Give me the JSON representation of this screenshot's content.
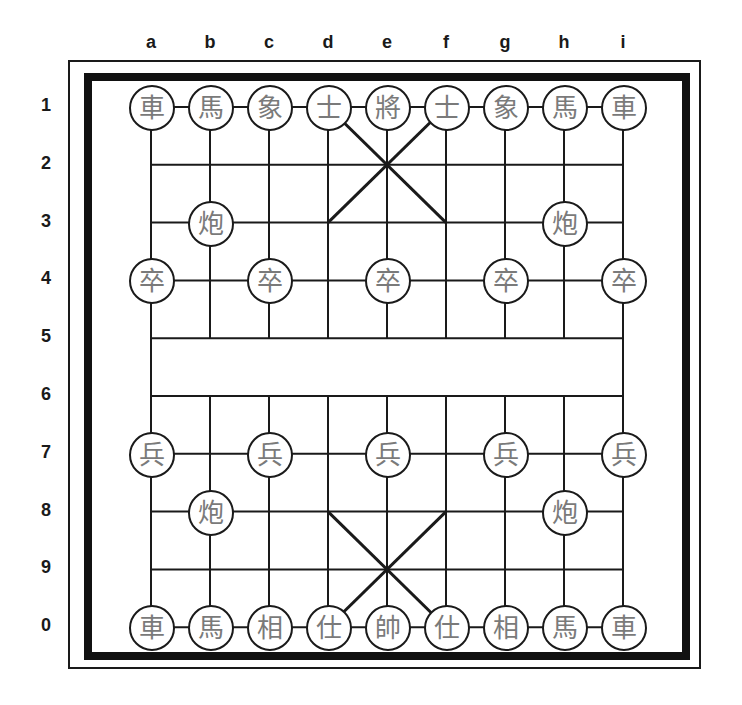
{
  "board": {
    "files": [
      "a",
      "b",
      "c",
      "d",
      "e",
      "f",
      "g",
      "h",
      "i"
    ],
    "ranks": [
      "1",
      "2",
      "3",
      "4",
      "5",
      "6",
      "7",
      "8",
      "9",
      "0"
    ],
    "colors": {
      "line": "#1a1a1a",
      "frame": "#111111",
      "piece_text": "#7a7a7a",
      "piece_bg": "#ffffff"
    },
    "river_text": ""
  },
  "pieces": [
    {
      "square": "a1",
      "glyph": "車",
      "name": "chariot"
    },
    {
      "square": "b1",
      "glyph": "馬",
      "name": "horse"
    },
    {
      "square": "c1",
      "glyph": "象",
      "name": "elephant"
    },
    {
      "square": "d1",
      "glyph": "士",
      "name": "advisor"
    },
    {
      "square": "e1",
      "glyph": "將",
      "name": "general"
    },
    {
      "square": "f1",
      "glyph": "士",
      "name": "advisor"
    },
    {
      "square": "g1",
      "glyph": "象",
      "name": "elephant"
    },
    {
      "square": "h1",
      "glyph": "馬",
      "name": "horse"
    },
    {
      "square": "i1",
      "glyph": "車",
      "name": "chariot"
    },
    {
      "square": "b3",
      "glyph": "炮",
      "name": "cannon"
    },
    {
      "square": "h3",
      "glyph": "炮",
      "name": "cannon"
    },
    {
      "square": "a4",
      "glyph": "卒",
      "name": "soldier"
    },
    {
      "square": "c4",
      "glyph": "卒",
      "name": "soldier"
    },
    {
      "square": "e4",
      "glyph": "卒",
      "name": "soldier"
    },
    {
      "square": "g4",
      "glyph": "卒",
      "name": "soldier"
    },
    {
      "square": "i4",
      "glyph": "卒",
      "name": "soldier"
    },
    {
      "square": "a7",
      "glyph": "兵",
      "name": "soldier"
    },
    {
      "square": "c7",
      "glyph": "兵",
      "name": "soldier"
    },
    {
      "square": "e7",
      "glyph": "兵",
      "name": "soldier"
    },
    {
      "square": "g7",
      "glyph": "兵",
      "name": "soldier"
    },
    {
      "square": "i7",
      "glyph": "兵",
      "name": "soldier"
    },
    {
      "square": "b8",
      "glyph": "炮",
      "name": "cannon"
    },
    {
      "square": "h8",
      "glyph": "炮",
      "name": "cannon"
    },
    {
      "square": "a0",
      "glyph": "車",
      "name": "chariot"
    },
    {
      "square": "b0",
      "glyph": "馬",
      "name": "horse"
    },
    {
      "square": "c0",
      "glyph": "相",
      "name": "elephant"
    },
    {
      "square": "d0",
      "glyph": "仕",
      "name": "advisor"
    },
    {
      "square": "e0",
      "glyph": "帥",
      "name": "general"
    },
    {
      "square": "f0",
      "glyph": "仕",
      "name": "advisor"
    },
    {
      "square": "g0",
      "glyph": "相",
      "name": "elephant"
    },
    {
      "square": "h0",
      "glyph": "馬",
      "name": "horse"
    },
    {
      "square": "i0",
      "glyph": "車",
      "name": "chariot"
    }
  ]
}
